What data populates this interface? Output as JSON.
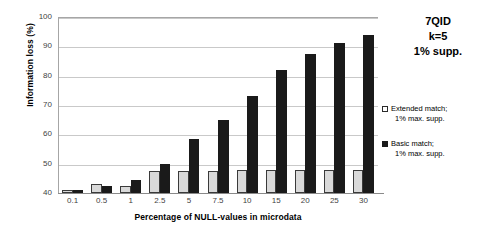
{
  "chart_data": {
    "type": "bar",
    "title": "",
    "xlabel": "Percentage of NULL-values in microdata",
    "ylabel": "Information loss (%)",
    "categories": [
      "0.1",
      "0.5",
      "1",
      "2.5",
      "5",
      "7.5",
      "10",
      "15",
      "20",
      "25",
      "30"
    ],
    "series": [
      {
        "name": "Extended match; 1% max. supp.",
        "color": "#d9d9d9",
        "values": [
          41,
          43,
          42.5,
          47.5,
          47.5,
          47.5,
          48,
          48,
          48,
          48,
          48
        ]
      },
      {
        "name": "Basic match; 1% max. supp.",
        "color": "#1a1a1a",
        "values": [
          41,
          42.5,
          44.5,
          50,
          58.5,
          65,
          73,
          82,
          87.5,
          91,
          94
        ]
      }
    ],
    "ylim": [
      40,
      100
    ],
    "yticks": [
      40,
      50,
      60,
      70,
      80,
      90,
      100
    ],
    "grid": true,
    "legend_position": "right"
  },
  "annotations": {
    "title_lines": [
      "7QID",
      "k=5",
      "1% supp."
    ]
  },
  "legend": {
    "entries": [
      {
        "line1": "Extended match;",
        "line2": "1% max. supp.",
        "marker": "hollow-square-icon"
      },
      {
        "line1": "Basic match;",
        "line2": "1% max. supp.",
        "marker": "filled-square-icon"
      }
    ]
  }
}
